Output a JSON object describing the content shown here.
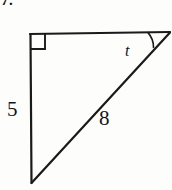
{
  "figure": {
    "problem_number": "7.",
    "type": "right-triangle-diagram",
    "stroke_color": "#1a1a1a",
    "background_color": "#fdfdfc",
    "labels": {
      "vertical_leg": "5",
      "hypotenuse": "8",
      "angle": "t"
    },
    "geometry": {
      "vertex_top_left": [
        30,
        34
      ],
      "vertex_top_right": [
        170,
        32
      ],
      "vertex_bottom_left": [
        31,
        183
      ],
      "right_angle_marker_size": 14,
      "angle_arc_radius": 22
    }
  }
}
